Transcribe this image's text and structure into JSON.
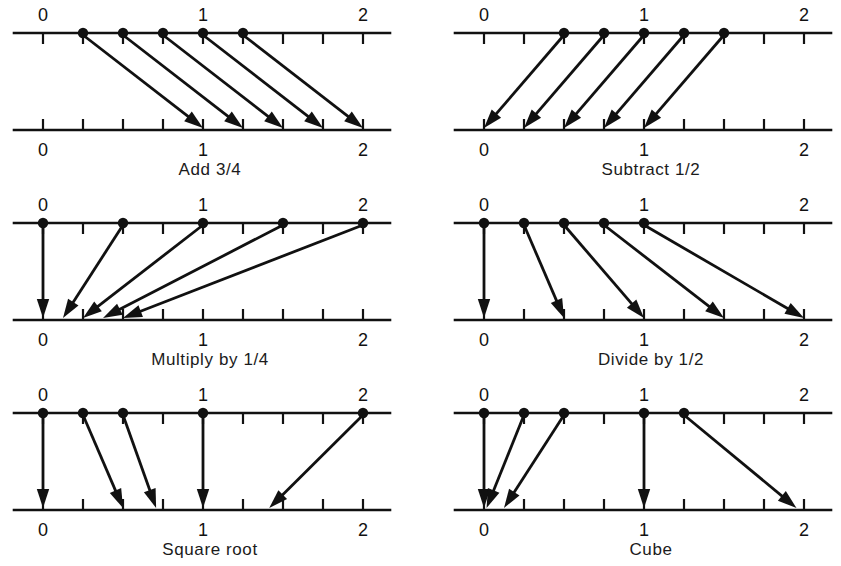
{
  "figure": {
    "title": "",
    "axis_labels": [
      "0",
      "1",
      "2"
    ],
    "axis_min": 0,
    "axis_max": 2,
    "ticks_per_unit": 4,
    "line_color": "#111111",
    "dot_color": "#111111",
    "background": "#ffffff"
  },
  "chart_data": {
    "type": "diagram",
    "xlabel": "",
    "ylabel": "",
    "xlim": [
      0,
      2
    ],
    "grid": false,
    "legend": null,
    "panels": [
      {
        "id": "add-three-quarters",
        "caption": "Add 3/4",
        "rule": "x + 3/4",
        "top_axis_ticks": [
          "0",
          "1",
          "2"
        ],
        "bottom_axis_ticks": [
          "0",
          "1",
          "2"
        ],
        "points": [
          {
            "from": 0.25,
            "to": 1.0
          },
          {
            "from": 0.5,
            "to": 1.25
          },
          {
            "from": 0.75,
            "to": 1.5
          },
          {
            "from": 1.0,
            "to": 1.75
          },
          {
            "from": 1.25,
            "to": 2.0
          }
        ]
      },
      {
        "id": "subtract-one-half",
        "caption": "Subtract 1/2",
        "rule": "x - 1/2",
        "top_axis_ticks": [
          "0",
          "1",
          "2"
        ],
        "bottom_axis_ticks": [
          "0",
          "1",
          "2"
        ],
        "points": [
          {
            "from": 0.5,
            "to": 0.0
          },
          {
            "from": 0.75,
            "to": 0.25
          },
          {
            "from": 1.0,
            "to": 0.5
          },
          {
            "from": 1.25,
            "to": 0.75
          },
          {
            "from": 1.5,
            "to": 1.0
          }
        ]
      },
      {
        "id": "multiply-by-one-quarter",
        "caption": "Multiply by 1/4",
        "rule": "x × 1/4",
        "top_axis_ticks": [
          "0",
          "1",
          "2"
        ],
        "bottom_axis_ticks": [
          "0",
          "1",
          "2"
        ],
        "points": [
          {
            "from": 0.0,
            "to": 0.0
          },
          {
            "from": 0.5,
            "to": 0.125
          },
          {
            "from": 1.0,
            "to": 0.25
          },
          {
            "from": 1.5,
            "to": 0.375
          },
          {
            "from": 2.0,
            "to": 0.5
          }
        ]
      },
      {
        "id": "divide-by-one-half",
        "caption": "Divide by 1/2",
        "rule": "x ÷ 1/2",
        "top_axis_ticks": [
          "0",
          "1",
          "2"
        ],
        "bottom_axis_ticks": [
          "0",
          "1",
          "2"
        ],
        "points": [
          {
            "from": 0.0,
            "to": 0.0
          },
          {
            "from": 0.25,
            "to": 0.5
          },
          {
            "from": 0.5,
            "to": 1.0
          },
          {
            "from": 0.75,
            "to": 1.5
          },
          {
            "from": 1.0,
            "to": 2.0
          }
        ]
      },
      {
        "id": "square-root",
        "caption": "Square root",
        "rule": "√x",
        "top_axis_ticks": [
          "0",
          "1",
          "2"
        ],
        "bottom_axis_ticks": [
          "0",
          "1",
          "2"
        ],
        "points": [
          {
            "from": 0.0,
            "to": 0.0
          },
          {
            "from": 0.25,
            "to": 0.5
          },
          {
            "from": 0.5,
            "to": 0.707
          },
          {
            "from": 1.0,
            "to": 1.0
          },
          {
            "from": 2.0,
            "to": 1.414
          }
        ]
      },
      {
        "id": "cube",
        "caption": "Cube",
        "rule": "x³",
        "top_axis_ticks": [
          "0",
          "1",
          "2"
        ],
        "bottom_axis_ticks": [
          "0",
          "1",
          "2"
        ],
        "points": [
          {
            "from": 0.0,
            "to": 0.0
          },
          {
            "from": 0.25,
            "to": 0.016
          },
          {
            "from": 0.5,
            "to": 0.125
          },
          {
            "from": 1.0,
            "to": 1.0
          },
          {
            "from": 1.25,
            "to": 1.953
          }
        ]
      }
    ]
  }
}
